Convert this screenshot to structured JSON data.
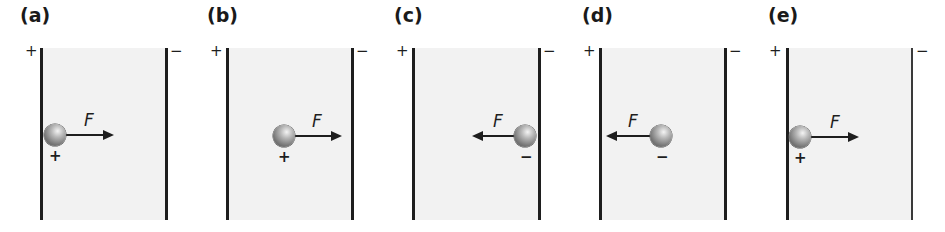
{
  "figure": {
    "colors": {
      "plate": "#1e1e1e",
      "field": "#f2f2f2",
      "sphere": "#888888",
      "text": "#1a1a1a"
    },
    "panels": [
      {
        "label": "(a)",
        "left_plate_sign": "+",
        "right_plate_sign": "−",
        "particle_charge": "+",
        "force_label": "F",
        "force_direction": "right",
        "particle_position": "touching left plate"
      },
      {
        "label": "(b)",
        "left_plate_sign": "+",
        "right_plate_sign": "−",
        "particle_charge": "+",
        "force_label": "F",
        "force_direction": "right",
        "particle_position": "middle"
      },
      {
        "label": "(c)",
        "left_plate_sign": "+",
        "right_plate_sign": "−",
        "particle_charge": "−",
        "force_label": "F",
        "force_direction": "left",
        "particle_position": "touching right plate"
      },
      {
        "label": "(d)",
        "left_plate_sign": "+",
        "right_plate_sign": "−",
        "particle_charge": "−",
        "force_label": "F",
        "force_direction": "left",
        "particle_position": "middle"
      },
      {
        "label": "(e)",
        "left_plate_sign": "+",
        "right_plate_sign": "−",
        "particle_charge": "+",
        "force_label": "F",
        "force_direction": "right",
        "particle_position": "touching left plate"
      }
    ]
  }
}
